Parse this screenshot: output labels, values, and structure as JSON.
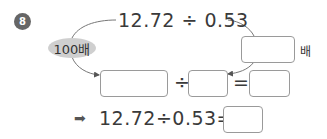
{
  "problem": {
    "number": "8",
    "top_expression": "12.72 ÷ 0.53",
    "left_multiplier_label": "100배",
    "right_multiplier_unit": "배",
    "right_multiplier_value": "",
    "row2": {
      "dividend_value": "",
      "divide_symbol": "÷",
      "divisor_value": "",
      "equals_symbol": "=",
      "quotient_value": ""
    },
    "conclusion": {
      "arrow_symbol": "➡",
      "expression": "12.72÷0.53=",
      "answer_value": ""
    }
  },
  "colors": {
    "circle": "#666666",
    "oval": "#cfcfcf",
    "box_border": "#9a9a9a",
    "text": "#3a3a3a"
  }
}
